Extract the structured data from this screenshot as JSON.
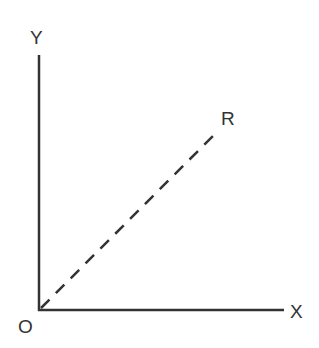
{
  "diagram": {
    "labels": {
      "y_axis": "Y",
      "x_axis": "X",
      "origin": "O",
      "ray_end": "R"
    },
    "colors": {
      "line": "#333333",
      "background": "#ffffff"
    },
    "line_styles": {
      "axes": "solid",
      "ray_OR": "dashed"
    }
  }
}
